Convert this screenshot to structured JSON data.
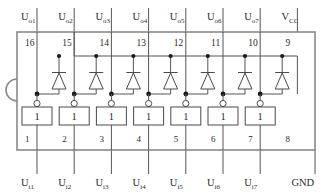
{
  "diagram": {
    "kind": "ic-pinout-schematic",
    "package": "DIP-16",
    "channel_count": 7,
    "colors": {
      "background": "#ffffff",
      "body_outline": "#8a8a8a",
      "wire": "#555555",
      "symbol": "#4a4a4a",
      "text": "#2b2b2b",
      "junction": "#1a1a1a"
    },
    "top_pins": [
      {
        "number": "16",
        "label_main": "U",
        "label_sub": "o1"
      },
      {
        "number": "15",
        "label_main": "U",
        "label_sub": "o2"
      },
      {
        "number": "14",
        "label_main": "U",
        "label_sub": "o3"
      },
      {
        "number": "13",
        "label_main": "U",
        "label_sub": "o4"
      },
      {
        "number": "12",
        "label_main": "U",
        "label_sub": "o5"
      },
      {
        "number": "11",
        "label_main": "U",
        "label_sub": "o6"
      },
      {
        "number": "10",
        "label_main": "U",
        "label_sub": "o7"
      },
      {
        "number": "9",
        "label_main": "V",
        "label_sub": "CC"
      }
    ],
    "bottom_pins": [
      {
        "number": "1",
        "label_main": "U",
        "label_sub": "i1"
      },
      {
        "number": "2",
        "label_main": "U",
        "label_sub": "i2"
      },
      {
        "number": "3",
        "label_main": "U",
        "label_sub": "i3"
      },
      {
        "number": "4",
        "label_main": "U",
        "label_sub": "i4"
      },
      {
        "number": "5",
        "label_main": "U",
        "label_sub": "i5"
      },
      {
        "number": "6",
        "label_main": "U",
        "label_sub": "i6"
      },
      {
        "number": "7",
        "label_main": "U",
        "label_sub": "i7"
      },
      {
        "number": "8",
        "label_main": "GND",
        "label_sub": ""
      }
    ],
    "gates": [
      {
        "symbol": "1"
      },
      {
        "symbol": "1"
      },
      {
        "symbol": "1"
      },
      {
        "symbol": "1"
      },
      {
        "symbol": "1"
      },
      {
        "symbol": "1"
      },
      {
        "symbol": "1"
      }
    ],
    "elements": {
      "notch_name": "pin-one-notch",
      "diode_name": "clamp-diode",
      "gate_name": "inverting-buffer",
      "bubble_name": "inversion-bubble",
      "vcc_rail_name": "vcc-rail"
    }
  }
}
